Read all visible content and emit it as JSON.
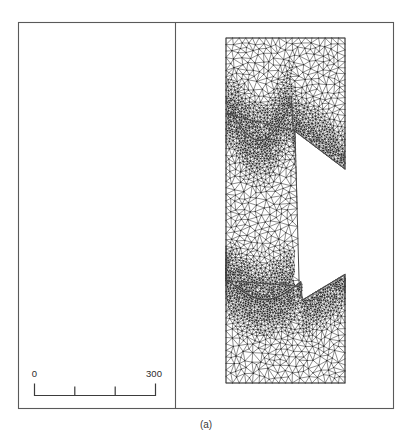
{
  "figure": {
    "caption": "(a)",
    "frame": {
      "x": 18,
      "y": 22,
      "width": 376,
      "height": 387
    },
    "divider_x": 175,
    "left_panel": {
      "empty": true
    }
  },
  "scalebar": {
    "min_label": "0",
    "max_label": "300",
    "units": "",
    "x_start": 34,
    "x_end": 155,
    "y_baseline": 395,
    "tick_count": 4,
    "tick_values": [
      0,
      100,
      200,
      300
    ],
    "tick_labels_shown": [
      "0",
      "",
      "",
      "300"
    ],
    "color": "#3b3b3b"
  },
  "mesh": {
    "name": "triangular-finite-element-mesh",
    "type": "unstructured-triangular",
    "domain_shape": "c-shaped-notched-rectangle",
    "bounds": {
      "x": 226,
      "y": 38,
      "width": 119,
      "height": 345
    },
    "edge_color": "#1a1a1a",
    "outline_color": "#4a4a4a",
    "refinement": "graded, refined near the two concave notch boundaries",
    "notches": [
      {
        "name": "upper-notch",
        "side": "right",
        "y_range": [
          95,
          152
        ]
      },
      {
        "name": "lower-notch",
        "side": "right",
        "y_range": [
          282,
          320
        ]
      }
    ]
  },
  "colors": {
    "frame": "#5a5a5a",
    "mesh_edge": "#1a1a1a",
    "text": "#2b2b2b",
    "background": "#ffffff"
  }
}
